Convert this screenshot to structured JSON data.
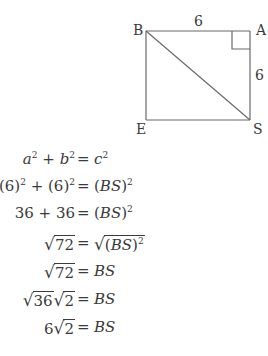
{
  "diagram": {
    "vertices": {
      "B": {
        "label": "B",
        "x": 146,
        "y": 31
      },
      "A": {
        "label": "A",
        "x": 250,
        "y": 31
      },
      "S": {
        "label": "S",
        "x": 250,
        "y": 120
      },
      "E": {
        "label": "E",
        "x": 146,
        "y": 120
      }
    },
    "side_labels": {
      "BA": "6",
      "AS": "6"
    },
    "right_angle_at": "A",
    "diagonal": "BS",
    "line_color": "#6a6a6a",
    "text_color": "#3a3a3a"
  },
  "equations": [
    {
      "lhs_parts": [
        "a",
        "2",
        " + ",
        "b",
        "2"
      ],
      "eq": "=",
      "rhs_parts": [
        "c",
        "2"
      ],
      "text": "a^2 + b^2 = c^2"
    },
    {
      "text": "(6)^2 + (6)^2 = (BS)^2"
    },
    {
      "text": "36 + 36 = (BS)^2"
    },
    {
      "text": "√72 = √((BS)^2)"
    },
    {
      "text": "√72 = BS"
    },
    {
      "text": "√36 √2 = BS"
    },
    {
      "text": "6√2 = BS"
    }
  ],
  "labels": {
    "six": "6",
    "two": "2",
    "seventy_two": "72",
    "thirty_six": "36",
    "thirty_six_plus": "36 + 36",
    "a": "a",
    "b": "b",
    "c": "c",
    "plus": " + ",
    "eq": "=",
    "bs": "BS",
    "lp": "(",
    "rp": ")",
    "paren6": "(6)",
    "radical": "√"
  }
}
